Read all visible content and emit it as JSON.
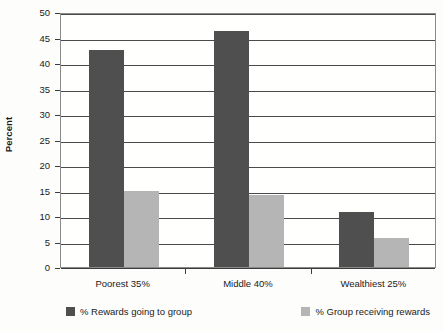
{
  "chart_data": {
    "type": "bar",
    "title": "",
    "subtitle": "",
    "xlabel": "",
    "ylabel": "Percent",
    "ylim": [
      0,
      50
    ],
    "ytick_step": 5,
    "yticks": [
      0,
      5,
      10,
      15,
      20,
      25,
      30,
      35,
      40,
      45,
      50
    ],
    "ytick_labels": [
      "0",
      "5",
      "10",
      "15",
      "20",
      "25",
      "30",
      "35",
      "40",
      "45",
      "50"
    ],
    "categories": [
      "Poorest 35%",
      "Middle 40%",
      "Wealthiest 25%"
    ],
    "series": [
      {
        "name": "% Rewards going to group",
        "color": "#4f4f4f",
        "values": [
          42.5,
          46.3,
          10.7
        ]
      },
      {
        "name": "% Group receiving rewards",
        "color": "#b5b5b5",
        "values": [
          15.0,
          14.1,
          5.7
        ]
      }
    ],
    "grid": true,
    "grid_axis": "y",
    "legend": true,
    "legend_position": "bottom",
    "bar_grouping": "adjacent",
    "annotations": []
  },
  "axes": {
    "y_title": "Percent"
  },
  "legend": {
    "entries": [
      {
        "label": "% Rewards going to group",
        "swatch": "series-0-swatch"
      },
      {
        "label": "% Group receiving rewards",
        "swatch": "series-1-swatch"
      }
    ]
  }
}
